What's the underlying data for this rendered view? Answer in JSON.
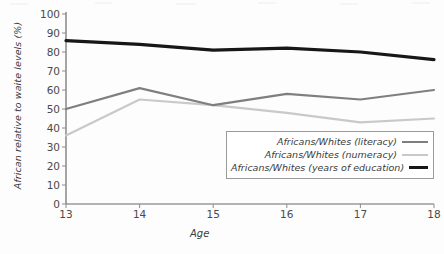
{
  "chart_data": {
    "type": "line",
    "title": "",
    "xlabel": "Age",
    "ylabel": "African relative to waite levels (%)",
    "x": [
      13,
      14,
      15,
      16,
      17,
      18
    ],
    "xticklabels": [
      "13",
      "14",
      "15",
      "16",
      "17",
      "18"
    ],
    "yticklabels": [
      "0",
      "10",
      "20",
      "30",
      "40",
      "50",
      "60",
      "70",
      "80",
      "90",
      "100"
    ],
    "yticks": [
      0,
      10,
      20,
      30,
      40,
      50,
      60,
      70,
      80,
      90,
      100
    ],
    "xlim": [
      13,
      18
    ],
    "ylim": [
      0,
      100
    ],
    "grid": false,
    "legend_position": "inside-lower-right",
    "series": [
      {
        "name": "Africans/Whites (literacy)",
        "key": "literacy",
        "color": "#7f7f7f",
        "width": 2.2,
        "values": [
          50,
          61,
          52,
          58,
          55,
          60
        ]
      },
      {
        "name": "Africans/Whites (numeracy)",
        "key": "numeracy",
        "color": "#c9c9c9",
        "width": 2.2,
        "values": [
          36,
          55,
          52,
          48,
          43,
          45
        ]
      },
      {
        "name": "Africans/Whites (years of education)",
        "key": "education",
        "color": "#171717",
        "width": 3.2,
        "values": [
          86,
          84,
          81,
          82,
          80,
          76
        ]
      }
    ]
  },
  "axes": {
    "axis_color": "#6b6b6b",
    "tick_color": "#8c8c8c"
  },
  "legend": {
    "items": [
      {
        "label": "Africans/Whites (literacy)",
        "swatch": "sw-lit"
      },
      {
        "label": "Africans/Whites (numeracy)",
        "swatch": "sw-num"
      },
      {
        "label": "Africans/Whites (years of education)",
        "swatch": "sw-edu"
      }
    ]
  }
}
